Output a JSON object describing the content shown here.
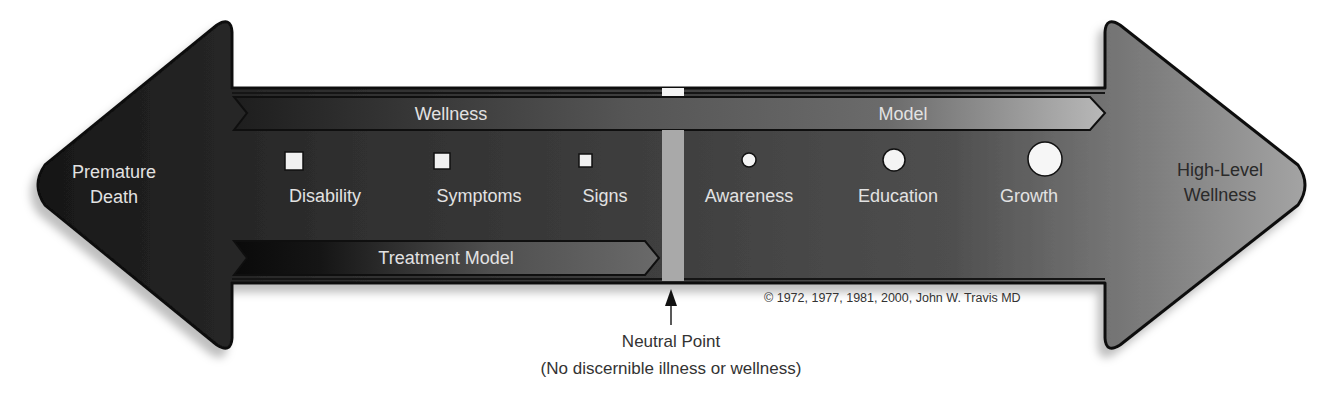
{
  "diagram": {
    "left_end": {
      "line1": "Premature",
      "line2": "Death"
    },
    "right_end": {
      "line1": "High-Level",
      "line2": "Wellness"
    },
    "bands": {
      "wellness_model": {
        "word1": "Wellness",
        "word2": "Model"
      },
      "treatment_model": {
        "label": "Treatment Model"
      }
    },
    "illness_markers": [
      {
        "label": "Disability",
        "shape": "square",
        "size": 16
      },
      {
        "label": "Symptoms",
        "shape": "square",
        "size": 14
      },
      {
        "label": "Signs",
        "shape": "square",
        "size": 12
      }
    ],
    "wellness_markers": [
      {
        "label": "Awareness",
        "shape": "circle",
        "size": 12
      },
      {
        "label": "Education",
        "shape": "circle",
        "size": 20
      },
      {
        "label": "Growth",
        "shape": "circle",
        "size": 28
      }
    ],
    "neutral_point": {
      "label": "Neutral Point",
      "sublabel": "(No discernible illness or wellness)"
    },
    "copyright": "© 1972, 1977, 1981, 2000, John W. Travis MD",
    "colors": {
      "dark_end": "#1a1a1a",
      "mid": "#4a4a4a",
      "light_end": "#9c9c9c",
      "neutral_bar": "#a9a9a9",
      "marker_fill": "#f4f4f4"
    }
  }
}
